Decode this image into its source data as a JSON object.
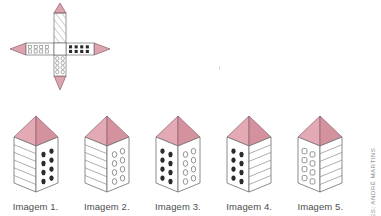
{
  "figure": {
    "credit": "ILUSTRAÇÕES: ANDRÉ MARTINS",
    "colors": {
      "roof_light": "#e3aab5",
      "roof_dark": "#d4919e",
      "outline": "#6e6e6e",
      "wall": "#ffffff",
      "window_filled": "#2b2b2b",
      "text": "#4d4d4d",
      "credit_text": "#8d8d8d",
      "background": "#ffffff"
    },
    "net": {
      "name": "unfolded-net",
      "description": "Planificação em cruz com quatro faces e quatro telhados triangulares",
      "faces": [
        {
          "position": "top",
          "pattern": "diagonal-lines",
          "label": "linhas diagonais"
        },
        {
          "position": "left",
          "pattern": "open-squares",
          "label": "quadrados vazados",
          "columns": 4,
          "rows": 2
        },
        {
          "position": "right",
          "pattern": "filled-dots",
          "label": "pontos pretos",
          "columns": 4,
          "rows": 2
        },
        {
          "position": "bottom",
          "pattern": "open-circles",
          "label": "círculos vazados",
          "columns": 2,
          "rows": 4
        },
        {
          "position": "center",
          "pattern": "blank",
          "label": "face central em branco"
        }
      ]
    },
    "buildings": [
      {
        "caption": "Imagem 1.",
        "left_face_pattern": "horizontal-lines",
        "right_face_pattern": "filled-dots",
        "right_face_columns": 2,
        "right_face_rows": 4
      },
      {
        "caption": "Imagem 2.",
        "left_face_pattern": "horizontal-lines",
        "right_face_pattern": "open-circles",
        "right_face_columns": 2,
        "right_face_rows": 4
      },
      {
        "caption": "Imagem 3.",
        "left_face_pattern": "filled-dots",
        "left_face_columns": 2,
        "left_face_rows": 4,
        "right_face_pattern": "open-circles",
        "right_face_columns": 2,
        "right_face_rows": 4
      },
      {
        "caption": "Imagem 4.",
        "left_face_pattern": "filled-dots",
        "left_face_columns": 2,
        "left_face_rows": 4,
        "right_face_pattern": "horizontal-lines"
      },
      {
        "caption": "Imagem 5.",
        "left_face_pattern": "open-rounded-squares",
        "left_face_columns": 2,
        "left_face_rows": 4,
        "right_face_pattern": "horizontal-lines"
      }
    ]
  }
}
